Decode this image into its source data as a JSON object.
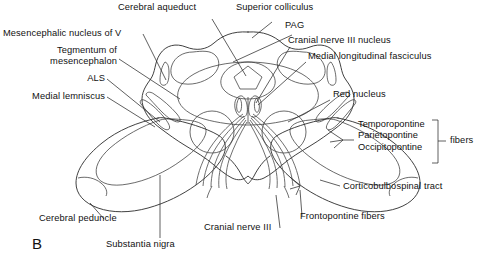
{
  "figure": {
    "panel_letter": "B",
    "background_color": "#ffffff",
    "line_color": "#2b2b2b",
    "fill_light": "#e6e6e6",
    "fill_mid": "#d4d4d4",
    "fill_dark": "#8f8f8f",
    "fill_tegmentum": "#dcdcdc"
  },
  "labels": {
    "cerebral_aqueduct": "Cerebral aqueduct",
    "superior_colliculus": "Superior colliculus",
    "pag": "PAG",
    "cranial_nerve_iii_nucleus": "Cranial nerve III nucleus",
    "medial_longitudinal_fasciculus": "Medial longitudinal fasciculus",
    "red_nucleus": "Red nucleus",
    "mesencephalic_nucleus_of_v": "Mesencephalic nucleus of V",
    "tegmentum_line1": "Tegmentum of",
    "tegmentum_line2": "mesencephalon",
    "als": "ALS",
    "medial_lemniscus": "Medial lemniscus",
    "cerebral_peduncle": "Cerebral peduncle",
    "substantia_nigra": "Substantia nigra",
    "cranial_nerve_iii": "Cranial nerve III",
    "corticobulbospinal_tract": "Corticobulbospinal tract",
    "frontopontine_fibers": "Frontopontine fibers"
  },
  "fiber_group": {
    "items": [
      "Temporopontine",
      "Parietopontine",
      "Occipitopontine"
    ],
    "bracket_label": "fibers"
  }
}
